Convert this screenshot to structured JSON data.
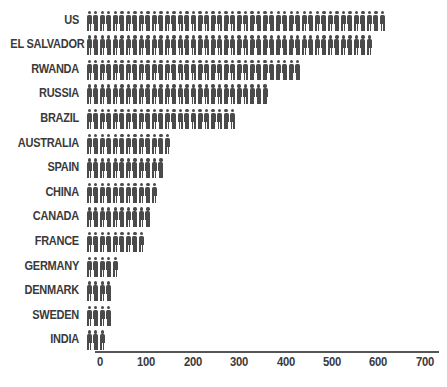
{
  "chart_data": {
    "type": "bar",
    "subtype": "pictogram",
    "title": "",
    "subtitle": "",
    "xlabel": "",
    "ylabel": "",
    "orientation": "horizontal",
    "grid": false,
    "legend": "none",
    "xlim": [
      0,
      700
    ],
    "xticks": [
      0,
      100,
      200,
      300,
      400,
      500,
      600,
      700
    ],
    "xtick_labels": [
      "0",
      "100",
      "200",
      "300",
      "400",
      "500",
      "600",
      "700"
    ],
    "icon": "person-icon",
    "icon_unit_value": 14,
    "colors": {
      "icon": "#4a4a4a",
      "label": "#3a3a3a",
      "axis": "#555555",
      "background": "#ffffff"
    },
    "categories": [
      "US",
      "EL SALVADOR",
      "RWANDA",
      "RUSSIA",
      "BRAZIL",
      "AUSTRALIA",
      "SPAIN",
      "CHINA",
      "CANADA",
      "FRANCE",
      "GERMANY",
      "DENMARK",
      "SWEDEN",
      "INDIA"
    ],
    "values": [
      650,
      615,
      465,
      390,
      325,
      185,
      170,
      155,
      140,
      125,
      70,
      55,
      55,
      40
    ],
    "icon_counts": [
      46,
      44,
      33,
      28,
      23,
      13,
      12,
      11,
      10,
      9,
      5,
      4,
      4,
      3
    ],
    "rows": [
      {
        "label": "US",
        "value": 650,
        "icons": 46
      },
      {
        "label": "EL SALVADOR",
        "value": 615,
        "icons": 44
      },
      {
        "label": "RWANDA",
        "value": 465,
        "icons": 33
      },
      {
        "label": "RUSSIA",
        "value": 390,
        "icons": 28
      },
      {
        "label": "BRAZIL",
        "value": 325,
        "icons": 23
      },
      {
        "label": "AUSTRALIA",
        "value": 185,
        "icons": 13
      },
      {
        "label": "SPAIN",
        "value": 170,
        "icons": 12
      },
      {
        "label": "CHINA",
        "value": 155,
        "icons": 11
      },
      {
        "label": "CANADA",
        "value": 140,
        "icons": 10
      },
      {
        "label": "FRANCE",
        "value": 125,
        "icons": 9
      },
      {
        "label": "GERMANY",
        "value": 70,
        "icons": 5
      },
      {
        "label": "DENMARK",
        "value": 55,
        "icons": 4
      },
      {
        "label": "SWEDEN",
        "value": 55,
        "icons": 4
      },
      {
        "label": "INDIA",
        "value": 40,
        "icons": 3
      }
    ]
  }
}
